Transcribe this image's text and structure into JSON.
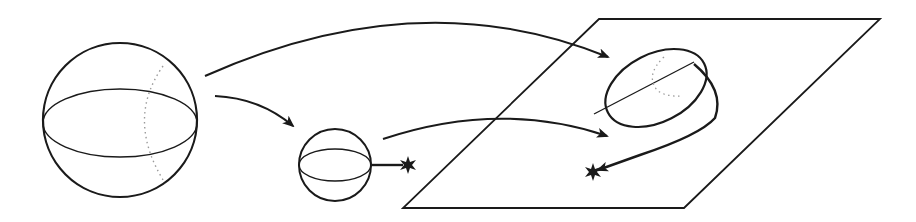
{
  "diagram": {
    "colors": {
      "stroke": "#1a1a1a",
      "dotted": "#9a9a9a",
      "background": "#ffffff"
    },
    "elements": [
      {
        "id": "large-sphere",
        "type": "sphere",
        "cx": 120,
        "cy": 120,
        "r": 77,
        "equator_ry": 34
      },
      {
        "id": "small-sphere",
        "type": "sphere",
        "cx": 335,
        "cy": 165,
        "r": 36,
        "equator_ry": 16
      },
      {
        "id": "marked-point-1",
        "type": "star",
        "x": 407,
        "y": 165
      },
      {
        "id": "plane",
        "type": "parallelogram",
        "points": [
          [
            599,
            19
          ],
          [
            880,
            19
          ],
          [
            684,
            208
          ],
          [
            403,
            208
          ]
        ]
      },
      {
        "id": "ellipsoid",
        "type": "ellipsoid",
        "cx": 656,
        "cy": 88,
        "rx": 53,
        "ry": 33,
        "rotation": -27
      },
      {
        "id": "marked-point-2",
        "type": "star",
        "x": 593,
        "y": 172
      }
    ],
    "arrows": [
      {
        "id": "arrow-top",
        "from": "large-sphere",
        "to": "ellipsoid"
      },
      {
        "id": "arrow-middle",
        "from": "large-sphere",
        "to": "small-sphere"
      },
      {
        "id": "arrow-lower",
        "from": "small-sphere",
        "to": "plane"
      },
      {
        "id": "loop-curve",
        "from": "ellipsoid",
        "to": "marked-point-2"
      }
    ]
  }
}
